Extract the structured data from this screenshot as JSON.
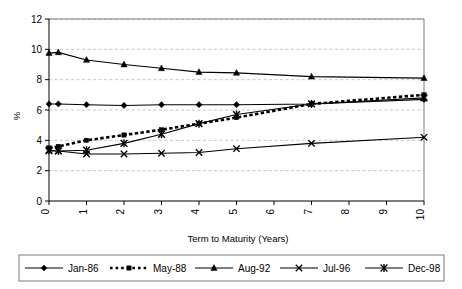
{
  "chart_data": {
    "type": "line",
    "title": "",
    "xlabel": "Term to Maturity (Years)",
    "ylabel": "%",
    "xlim": [
      0,
      10
    ],
    "ylim": [
      0,
      12
    ],
    "xticks": [
      "0",
      "1",
      "2",
      "3",
      "4",
      "5",
      "6",
      "7",
      "8",
      "9",
      "10"
    ],
    "yticks": [
      "0",
      "2",
      "4",
      "6",
      "8",
      "10",
      "12"
    ],
    "grid": "horizontal-dashed",
    "legend_position": "bottom",
    "x": [
      0,
      0.25,
      1,
      2,
      3,
      4,
      5,
      7,
      10
    ],
    "series": [
      {
        "name": "Jan-86",
        "marker": "diamond",
        "linestyle": "solid",
        "color": "#000000",
        "values": [
          6.4,
          6.4,
          6.35,
          6.3,
          6.35,
          6.35,
          6.35,
          6.4,
          6.7
        ]
      },
      {
        "name": "May-88",
        "marker": "square",
        "linestyle": "dotted",
        "color": "#000000",
        "values": [
          3.5,
          3.6,
          4.0,
          4.35,
          4.7,
          5.1,
          5.5,
          6.4,
          7.0
        ]
      },
      {
        "name": "Aug-92",
        "marker": "triangle",
        "linestyle": "solid",
        "color": "#000000",
        "values": [
          9.75,
          9.8,
          9.3,
          9.0,
          8.75,
          8.5,
          8.45,
          8.2,
          8.1
        ]
      },
      {
        "name": "Jul-96",
        "marker": "cross",
        "linestyle": "solid",
        "color": "#000000",
        "values": [
          3.3,
          3.3,
          3.1,
          3.1,
          3.15,
          3.2,
          3.45,
          3.8,
          4.2
        ]
      },
      {
        "name": "Dec-98",
        "marker": "asterisk",
        "linestyle": "solid",
        "color": "#000000",
        "values": [
          3.35,
          3.3,
          3.35,
          3.8,
          4.4,
          5.1,
          5.7,
          6.4,
          6.8
        ]
      }
    ]
  },
  "legend": {
    "items": [
      {
        "label": "Jan-86"
      },
      {
        "label": "May-88"
      },
      {
        "label": "Aug-92"
      },
      {
        "label": "Jul-96"
      },
      {
        "label": "Dec-98"
      }
    ]
  },
  "colors": {
    "axis": "#000000",
    "grid": "#b8b8b8",
    "plot_border": "#7a7a7a",
    "legend_border": "#7a7a7a",
    "background": "#ffffff"
  }
}
